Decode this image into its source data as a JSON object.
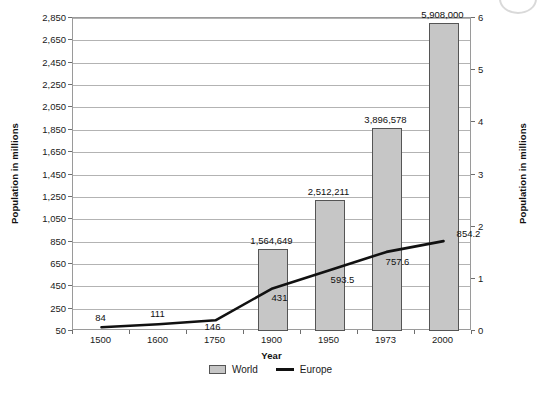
{
  "chart_data": {
    "type": "bar",
    "title": "",
    "subtitle": "",
    "xlabel": "Year",
    "ylabel": "Population in millions",
    "ylabel_right": "Population in millions",
    "categories": [
      "1500",
      "1600",
      "1750",
      "1900",
      "1950",
      "1973",
      "2000"
    ],
    "grid": true,
    "legend_position": "bottom",
    "left_axis": {
      "label": "Population in millions",
      "ticks": [
        50,
        250,
        450,
        650,
        850,
        1050,
        1250,
        1450,
        1650,
        1850,
        2050,
        2250,
        2450,
        2650,
        2850
      ],
      "tick_labels": [
        "50",
        "250",
        "450",
        "650",
        "850",
        "1,050",
        "1,250",
        "1,450",
        "1,650",
        "1,850",
        "2,050",
        "2,250",
        "2,450",
        "2,650",
        "2,850"
      ],
      "ylim": [
        50,
        2850
      ]
    },
    "right_axis": {
      "label": "Population in millions",
      "ticks": [
        0,
        1,
        2,
        3,
        4,
        5,
        6
      ],
      "tick_labels": [
        "0",
        "1",
        "2",
        "3",
        "4",
        "5",
        "6"
      ],
      "ylim": [
        0,
        6
      ]
    },
    "series": [
      {
        "name": "World",
        "type": "bar",
        "axis": "right",
        "color": "#c6c6c6",
        "edge_color": "#555555",
        "values": [
          null,
          null,
          null,
          1.564649,
          2.512211,
          3.896578,
          5.908
        ],
        "data_labels": [
          "",
          "",
          "",
          "1,564,649",
          "2,512,211",
          "3,896,578",
          "5,908,000"
        ]
      },
      {
        "name": "Europe",
        "type": "line",
        "axis": "left",
        "color": "#111111",
        "values": [
          84,
          111,
          146,
          431,
          593.5,
          757.6,
          854.2
        ],
        "data_labels": [
          "84",
          "111",
          "146",
          "431",
          "593.5",
          "757.6",
          "854.2"
        ]
      }
    ]
  },
  "legend": {
    "items": [
      {
        "label": "World",
        "marker": "bar-swatch"
      },
      {
        "label": "Europe",
        "marker": "line-swatch"
      }
    ]
  }
}
